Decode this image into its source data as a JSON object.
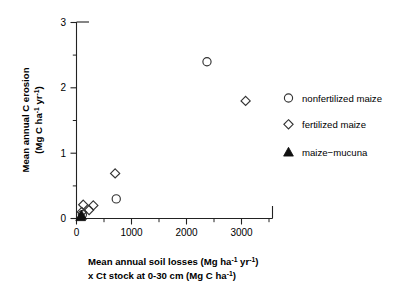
{
  "figure": {
    "background_color": "#ffffff",
    "axis_color": "#222222"
  },
  "chart_data": {
    "type": "scatter",
    "title": "",
    "xlabel_line1": "Mean annual soil losses (Mg ha",
    "xlabel_line1_sup1": "-1",
    "xlabel_line1_mid": " yr",
    "xlabel_line1_sup2": "-1",
    "xlabel_line1_end": ")",
    "xlabel_line2": "x Ct stock at 0-30 cm (Mg C ha",
    "xlabel_line2_sup": "-1",
    "xlabel_line2_end": ")",
    "ylabel_line1": "Mean annual C erosion",
    "ylabel_line2": "(Mg C ha",
    "ylabel_line2_sup1": "-1",
    "ylabel_line2_mid": " yr",
    "ylabel_line2_sup2": "-1",
    "ylabel_line2_end": ")",
    "xlim": [
      0,
      3500
    ],
    "ylim": [
      0,
      3
    ],
    "xticks": [
      0,
      1000,
      2000,
      3000
    ],
    "xticklabels": [
      "0",
      "1000",
      "2000",
      "3000"
    ],
    "yticks": [
      0,
      1,
      2,
      3
    ],
    "yticklabels": [
      "0",
      "1",
      "2",
      "3"
    ],
    "xminorticks": [
      500,
      1500,
      2500,
      3500
    ],
    "yminorticks": [
      0.5,
      1.5,
      2.5
    ],
    "grid": false,
    "legend_position": "right",
    "series": [
      {
        "name": "nonfertilized maize",
        "marker": "circle-open",
        "points": [
          {
            "x": 2330,
            "y": 2.4
          },
          {
            "x": 710,
            "y": 0.3
          },
          {
            "x": 105,
            "y": 0.06
          }
        ]
      },
      {
        "name": "fertilized maize",
        "marker": "diamond-open",
        "points": [
          {
            "x": 3020,
            "y": 1.8
          },
          {
            "x": 690,
            "y": 0.69
          },
          {
            "x": 300,
            "y": 0.2
          },
          {
            "x": 225,
            "y": 0.13
          },
          {
            "x": 120,
            "y": 0.21
          },
          {
            "x": 95,
            "y": 0.1
          }
        ]
      },
      {
        "name": "maize−mucuna",
        "marker": "triangle-filled",
        "points": [
          {
            "x": 90,
            "y": 0.05
          },
          {
            "x": 75,
            "y": 0.03
          }
        ]
      }
    ]
  },
  "legend": {
    "entries": [
      {
        "label": "nonfertilized maize",
        "marker": "circle-open"
      },
      {
        "label": "fertilized maize",
        "marker": "diamond-open"
      },
      {
        "label": "maize−mucuna",
        "marker": "triangle-filled"
      }
    ]
  }
}
